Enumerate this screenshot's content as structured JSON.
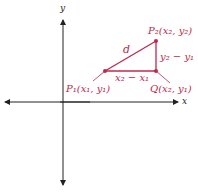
{
  "diagram": {
    "axes": {
      "x_label": "x",
      "y_label": "y",
      "color": "#222222"
    },
    "accent_color": "#c0284a",
    "points": {
      "p1": {
        "name": "P",
        "sub": "1",
        "coords": "(x₁, y₁)",
        "label": "P₁(x₁, y₁)"
      },
      "p2": {
        "name": "P",
        "sub": "2",
        "coords": "(x₂, y₂)",
        "label": "P₂(x₂, y₂)"
      },
      "q": {
        "name": "Q",
        "coords": "(x₂, y₁)",
        "label": "Q(x₂, y₁)"
      }
    },
    "segments": {
      "hypotenuse_label": "d",
      "horizontal_label": "x₂ − x₁",
      "vertical_label": "y₂ − y₁"
    }
  }
}
